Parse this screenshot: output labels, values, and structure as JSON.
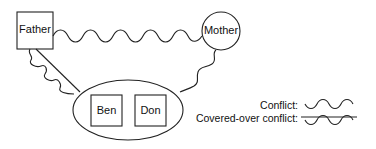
{
  "nodes": {
    "father": {
      "label": "Father",
      "shape": "square"
    },
    "mother": {
      "label": "Mother",
      "shape": "circle"
    },
    "children_group": {
      "shape": "ellipse"
    },
    "ben": {
      "label": "Ben",
      "shape": "square"
    },
    "don": {
      "label": "Don",
      "shape": "square"
    }
  },
  "edges": [
    {
      "from": "Father",
      "to": "Mother",
      "type": "conflict"
    },
    {
      "from": "Father",
      "to": "Ben & Don",
      "type": "covered-over conflict"
    },
    {
      "from": "Mother",
      "to": "Ben & Don",
      "type": "conflict"
    }
  ],
  "legend": {
    "conflict_label": "Conflict:",
    "covered_label": "Covered-over conflict:"
  },
  "colors": {
    "stroke": "#222222",
    "background": "#ffffff"
  }
}
